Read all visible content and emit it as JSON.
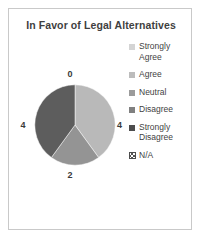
{
  "chart_data": {
    "type": "pie",
    "title": "In Favor of Legal Alternatives",
    "categories": [
      "Strongly Agree",
      "Agree",
      "Neutral",
      "Disagree",
      "Strongly Disagree",
      "N/A"
    ],
    "values": [
      4,
      0,
      0,
      2,
      4,
      0
    ],
    "data_labels": {
      "top": "0",
      "right": "4",
      "bottom": "2",
      "left": "4"
    },
    "slices": [
      {
        "label": "Strongly Agree",
        "value": 4,
        "color": "#b9b9b9",
        "start_deg": 0,
        "sweep_deg": 144
      },
      {
        "label": "Disagree",
        "value": 2,
        "color": "#949494",
        "start_deg": 144,
        "sweep_deg": 72
      },
      {
        "label": "Strongly Disagree",
        "value": 4,
        "color": "#5d5d5d",
        "start_deg": 216,
        "sweep_deg": 144
      }
    ],
    "legend": {
      "position": "right",
      "entries": [
        {
          "label": "Strongly Agree",
          "color": "#d4d4d4",
          "pattern": "solid"
        },
        {
          "label": "Agree",
          "color": "#bcbcbc",
          "pattern": "solid"
        },
        {
          "label": "Neutral",
          "color": "#9b9b9b",
          "pattern": "solid"
        },
        {
          "label": "Disagree",
          "color": "#808080",
          "pattern": "solid"
        },
        {
          "label": "Strongly Disagree",
          "color": "#4d4d4d",
          "pattern": "solid"
        },
        {
          "label": "N/A",
          "color": "#4d4d4d",
          "pattern": "hatched"
        }
      ]
    },
    "grid": false,
    "xlabel": "",
    "ylabel": ""
  }
}
